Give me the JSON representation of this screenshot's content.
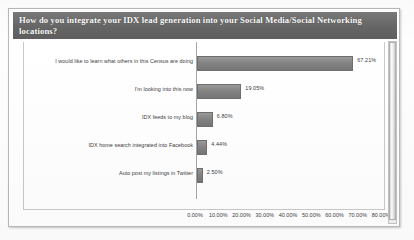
{
  "title": "How do you integrate your IDX lead generation into your Social Media/Social Networking locations?",
  "scrollbar": {
    "name": "vertical-scrollbar"
  },
  "chart_data": {
    "type": "bar",
    "orientation": "horizontal",
    "title": "How do you integrate your IDX lead generation into your Social Media/Social Networking locations?",
    "xlabel": "",
    "ylabel": "",
    "xlim": [
      0,
      80
    ],
    "grid": false,
    "legend": false,
    "categories": [
      "I would like to learn what others in this Census are doing",
      "I'm looking into this now",
      "IDX feeds to my blog",
      "IDX home search integrated into Facebook",
      "Auto post my listings in Twitter"
    ],
    "values": [
      67.21,
      19.05,
      6.8,
      4.44,
      2.5
    ],
    "value_labels": [
      "67.21%",
      "19.05%",
      "6.80%",
      "4.44%",
      "2.50%"
    ],
    "xticks": [
      0,
      10,
      20,
      30,
      40,
      50,
      60,
      70,
      80
    ],
    "xtick_labels": [
      "0.00%",
      "10.00%",
      "20.00%",
      "30.00%",
      "40.00%",
      "50.00%",
      "60.00%",
      "70.00%",
      "80.00%"
    ],
    "bar_color": "#8a8a8a",
    "title_bar_color": "#6e6e6e"
  }
}
